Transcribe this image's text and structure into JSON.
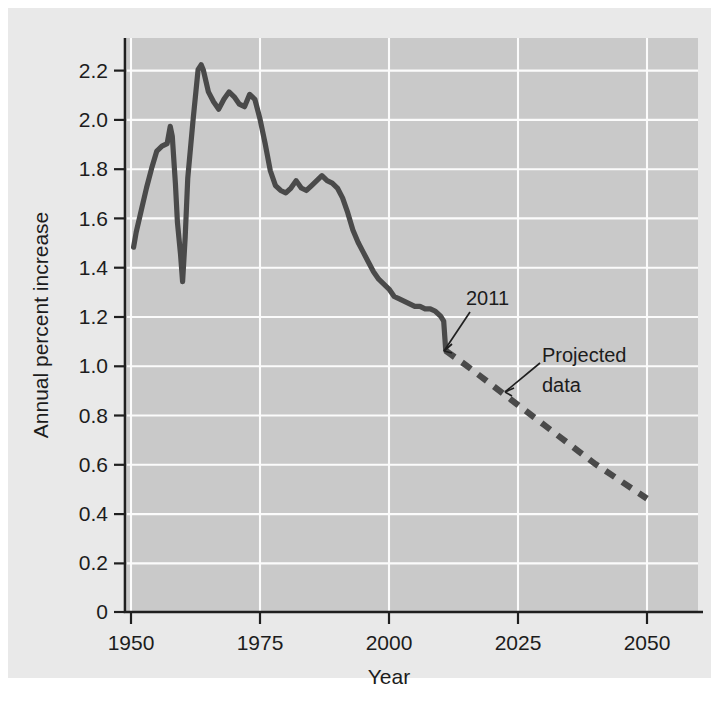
{
  "chart_data": {
    "type": "line",
    "title": "",
    "xlabel": "Year",
    "ylabel": "Annual percent increase",
    "xlim": [
      1950,
      2050
    ],
    "ylim": [
      0,
      2.3
    ],
    "xticks": [
      "1950",
      "1975",
      "2000",
      "2025",
      "2050"
    ],
    "xtick_values": [
      1950,
      1975,
      2000,
      2025,
      2050
    ],
    "yticks": [
      "0",
      "0.2",
      "0.4",
      "0.6",
      "0.8",
      "1.0",
      "1.2",
      "1.4",
      "1.6",
      "1.8",
      "2.0",
      "2.2"
    ],
    "ytick_values": [
      0,
      0.2,
      0.4,
      0.6,
      0.8,
      1.0,
      1.2,
      1.4,
      1.6,
      1.8,
      2.0,
      2.2
    ],
    "grid": true,
    "legend": "none",
    "colors": {
      "figure_background": "#e9e9e9",
      "plot_background": "#c9c9c9",
      "gridline": "#fbfbfb",
      "line": "#4a4a4a",
      "axis": "#1f1f1f",
      "text": "#1c1c1c"
    },
    "series": [
      {
        "name": "Observed data",
        "style": "solid",
        "x": [
          1950.5,
          1951,
          1952,
          1953,
          1954,
          1955,
          1956,
          1957,
          1957.6,
          1958,
          1958.6,
          1959,
          1959.6,
          1960,
          1960.5,
          1961,
          1962,
          1963,
          1963.6,
          1964,
          1965,
          1966,
          1967,
          1968,
          1969,
          1970,
          1971,
          1972,
          1973,
          1974,
          1975,
          1976,
          1977,
          1978,
          1979,
          1980,
          1981,
          1982,
          1983,
          1984,
          1985,
          1986,
          1987,
          1988,
          1989,
          1990,
          1991,
          1992,
          1993,
          1994,
          1995,
          1996,
          1997,
          1998,
          1999,
          2000,
          2001,
          2002,
          2003,
          2004,
          2005,
          2006,
          2007,
          2008,
          2009,
          2010,
          2010.6,
          2011
        ],
        "y": [
          1.48,
          1.54,
          1.63,
          1.72,
          1.8,
          1.87,
          1.89,
          1.9,
          1.97,
          1.93,
          1.74,
          1.58,
          1.45,
          1.34,
          1.52,
          1.76,
          1.99,
          2.2,
          2.22,
          2.2,
          2.11,
          2.07,
          2.04,
          2.08,
          2.11,
          2.09,
          2.06,
          2.05,
          2.1,
          2.08,
          2.0,
          1.9,
          1.79,
          1.73,
          1.71,
          1.7,
          1.72,
          1.75,
          1.72,
          1.71,
          1.73,
          1.75,
          1.77,
          1.75,
          1.74,
          1.72,
          1.68,
          1.62,
          1.55,
          1.5,
          1.46,
          1.42,
          1.38,
          1.35,
          1.33,
          1.31,
          1.28,
          1.27,
          1.26,
          1.25,
          1.24,
          1.24,
          1.23,
          1.23,
          1.22,
          1.2,
          1.18,
          1.06
        ]
      },
      {
        "name": "Projected data",
        "style": "dashed",
        "x": [
          2011,
          2015,
          2020,
          2025,
          2030,
          2035,
          2040,
          2045,
          2050
        ],
        "y": [
          1.06,
          1.0,
          0.92,
          0.84,
          0.76,
          0.68,
          0.6,
          0.53,
          0.46
        ]
      }
    ],
    "annotations": [
      {
        "name": "year-2011-annotation",
        "text": "2011",
        "points_to_x": 2011,
        "points_to_y": 1.1
      },
      {
        "name": "projected-data-annotation",
        "text_line1": "Projected",
        "text_line2": "data",
        "points_to_x": 2021,
        "points_to_y": 0.9
      }
    ]
  }
}
